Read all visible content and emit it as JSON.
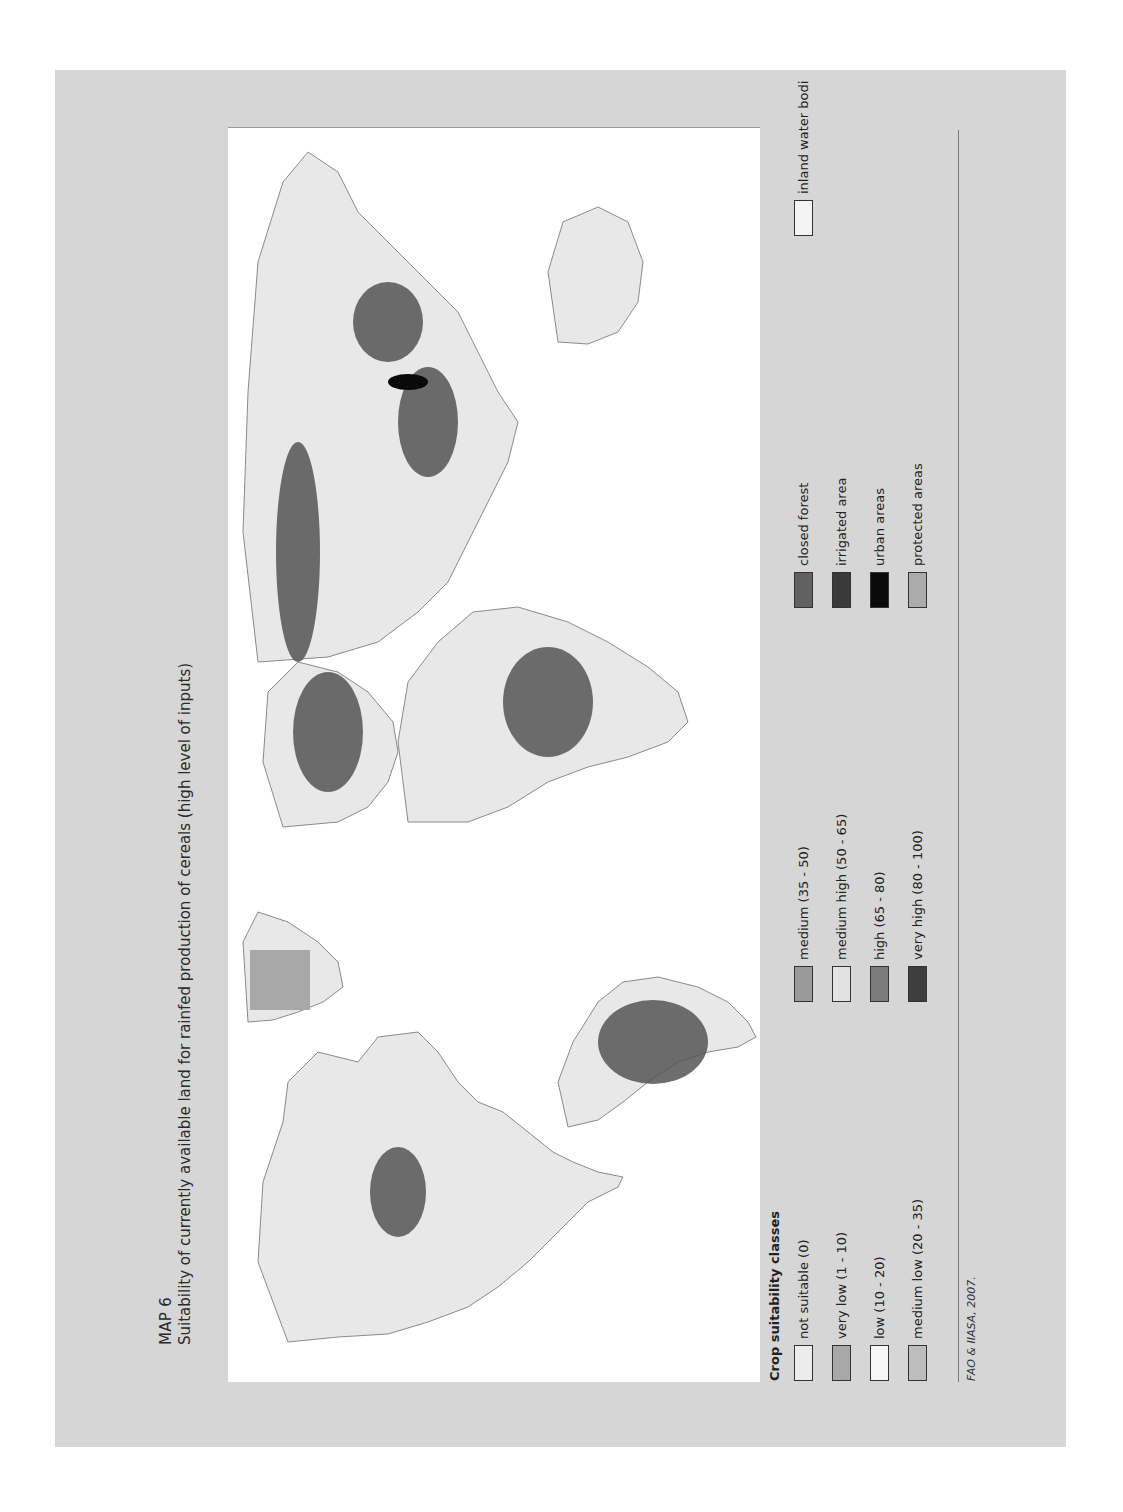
{
  "header": {
    "map_label": "MAP 6",
    "title": "Suitability of currently available land for rainfed production of cereals (high level of inputs)"
  },
  "legend": {
    "heading": "Crop suitability classes",
    "columns": [
      [
        {
          "label": "not suitable (0)",
          "color": "#ececec"
        },
        {
          "label": "very low (1 - 10)",
          "color": "#a8a8a8"
        },
        {
          "label": "low (10 - 20)",
          "color": "#f6f6f6"
        },
        {
          "label": "medium low (20 - 35)",
          "color": "#bdbdbd"
        }
      ],
      [
        {
          "label": "medium (35 - 50)",
          "color": "#9a9a9a"
        },
        {
          "label": "medium high (50 - 65)",
          "color": "#e2e2e2"
        },
        {
          "label": "high (65 - 80)",
          "color": "#7c7c7c"
        },
        {
          "label": "very high (80 - 100)",
          "color": "#3e3e3e"
        }
      ],
      [
        {
          "label": "closed forest",
          "color": "#616161"
        },
        {
          "label": "irrigated area",
          "color": "#3a3a3a"
        },
        {
          "label": "urban areas",
          "color": "#0a0a0a"
        },
        {
          "label": "protected areas",
          "color": "#ababab"
        }
      ],
      [
        {
          "label": "inland water bodi",
          "color": "#f4f4f4"
        }
      ]
    ]
  },
  "credit": "FAO & IIASA, 2007.",
  "colors": {
    "page_background": "#d6d6d6",
    "map_background": "#ffffff",
    "land_base": "#e8e8e8",
    "high_suitability": "#555555",
    "border_lines": "#8a8a8a"
  },
  "map": {
    "projection": "world",
    "regions": [
      "North America",
      "Greenland",
      "South America",
      "Europe",
      "Africa",
      "Asia",
      "Australia"
    ]
  }
}
